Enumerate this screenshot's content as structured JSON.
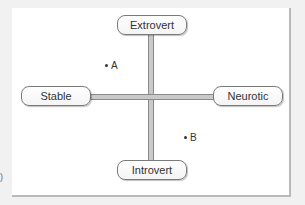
{
  "diagram": {
    "type": "personality-dimensions-cross",
    "axes": {
      "vertical": {
        "top": "Extrovert",
        "bottom": "Introvert"
      },
      "horizontal": {
        "left": "Stable",
        "right": "Neurotic"
      }
    },
    "points": [
      {
        "label": "A",
        "quadrant": "extrovert-stable"
      },
      {
        "label": "B",
        "quadrant": "introvert-neurotic"
      }
    ],
    "edge_fragment": ")"
  },
  "colors": {
    "background": "#f1f1f1",
    "panel": "#ffffff",
    "axis_edge": "#8a8a8a",
    "axis_fill": "#c9c9c9",
    "node_border": "#7a7a7a",
    "text": "#333333"
  }
}
